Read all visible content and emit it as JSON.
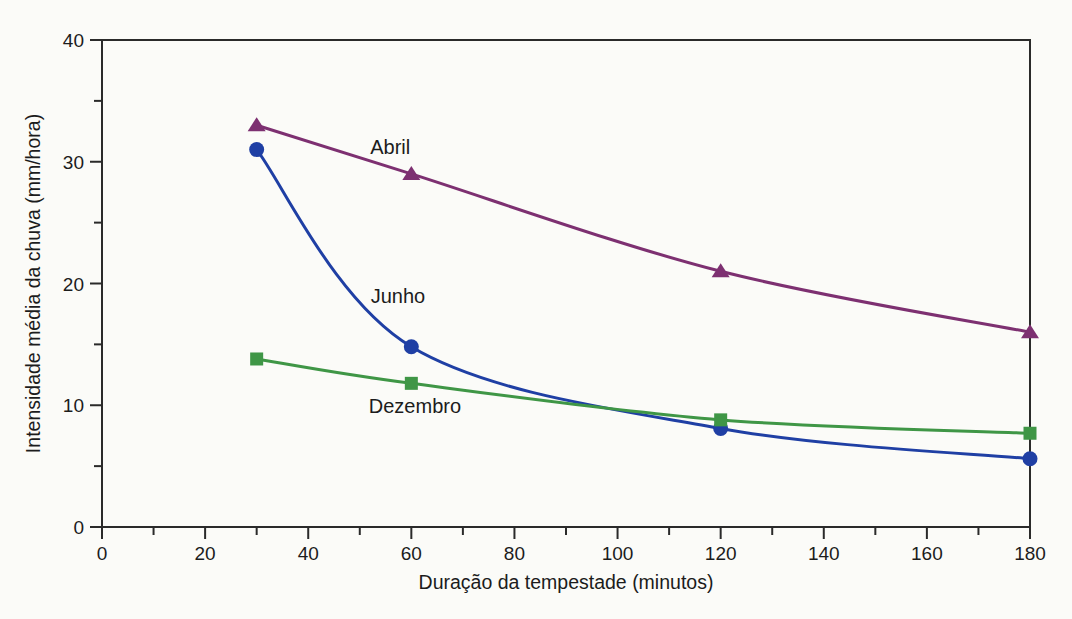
{
  "chart_data": {
    "type": "line",
    "xlabel": "Duração da tempestade (minutos)",
    "ylabel": "Intensidade média da chuva (mm/hora)",
    "xlim": [
      0,
      180
    ],
    "ylim": [
      0,
      40
    ],
    "x_ticks": [
      0,
      20,
      40,
      60,
      80,
      100,
      120,
      140,
      160,
      180
    ],
    "x_minor_step": 10,
    "y_ticks": [
      0,
      10,
      20,
      30,
      40
    ],
    "y_minor_step": 5,
    "grid": false,
    "legend": "inline-labels",
    "axis_color": "#2a2a2a",
    "text_color": "#1c1c1c",
    "series": [
      {
        "name": "Abril",
        "marker": "triangle",
        "color": "#7d3071",
        "x": [
          30,
          60,
          120,
          180
        ],
        "y": [
          33,
          29,
          21,
          16
        ],
        "label_pos": {
          "x": 55.9,
          "y": 31.2
        }
      },
      {
        "name": "Junho",
        "marker": "circle",
        "color": "#1f3fa4",
        "x": [
          30,
          60,
          120,
          180
        ],
        "y": [
          31,
          14.8,
          8.1,
          5.6
        ],
        "label_pos": {
          "x": 57.4,
          "y": 19.0
        }
      },
      {
        "name": "Dezembro",
        "marker": "square",
        "color": "#3f9646",
        "x": [
          30,
          60,
          120,
          180
        ],
        "y": [
          13.8,
          11.8,
          8.8,
          7.7
        ],
        "label_pos": {
          "x": 60.7,
          "y": 9.9
        }
      }
    ]
  }
}
